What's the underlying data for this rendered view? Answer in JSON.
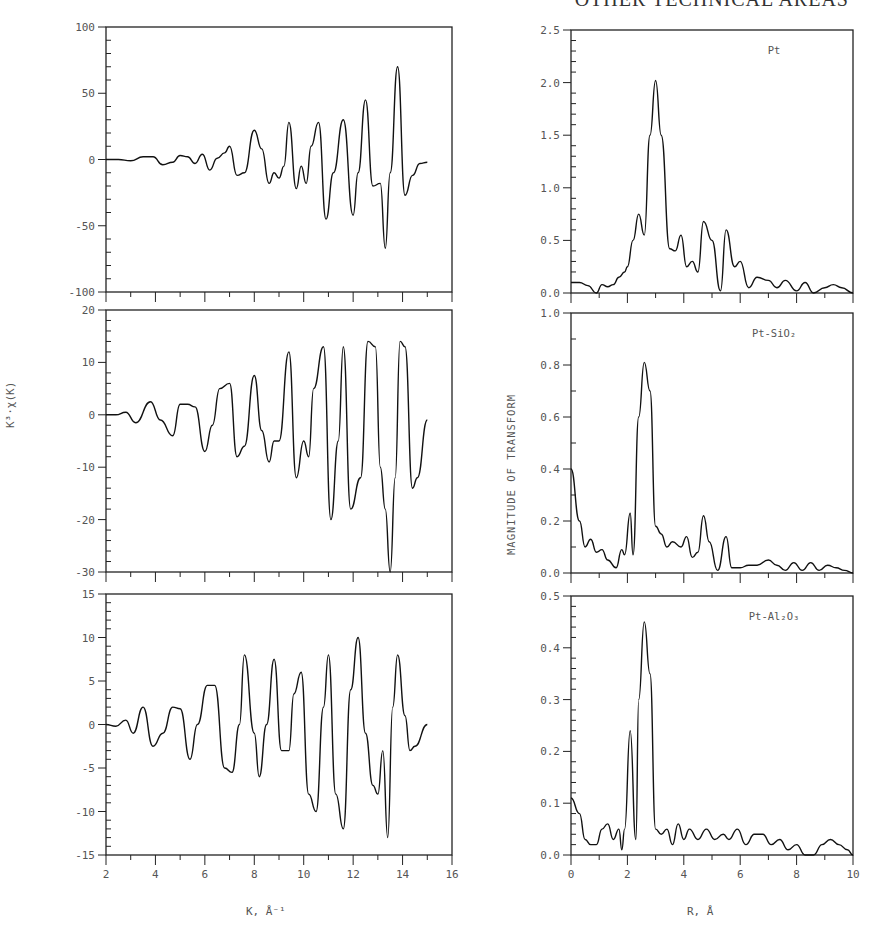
{
  "header": {
    "text": "OTHER TECHNICAL AREAS"
  },
  "left_column": {
    "ylabel": "K³·χ(K)",
    "xlabel": "K, Å⁻¹",
    "xticks": [
      "2",
      "4",
      "6",
      "8",
      "10",
      "12",
      "14",
      "16"
    ]
  },
  "right_column": {
    "ylabel": "MAGNITUDE OF TRANSFORM",
    "xlabel": "R, Å",
    "xticks": [
      "0",
      "2",
      "4",
      "6",
      "8",
      "10"
    ]
  },
  "chart_data": [
    {
      "id": "chi-pt",
      "type": "line",
      "panel": "left-top",
      "title": "",
      "xlabel": "K, Å⁻¹",
      "ylabel": "K³·χ(K)",
      "xlim": [
        2,
        16
      ],
      "ylim": [
        -100,
        100
      ],
      "yticks": [
        "100",
        "50",
        "0",
        "-50",
        "-100"
      ],
      "grid": false,
      "x": [
        2.0,
        2.5,
        3.0,
        3.5,
        3.9,
        4.3,
        4.7,
        5.0,
        5.3,
        5.6,
        5.9,
        6.2,
        6.5,
        6.8,
        7.0,
        7.3,
        7.6,
        8.0,
        8.3,
        8.6,
        8.8,
        9.0,
        9.2,
        9.4,
        9.7,
        9.9,
        10.1,
        10.3,
        10.6,
        10.9,
        11.2,
        11.6,
        12.0,
        12.2,
        12.5,
        12.8,
        13.1,
        13.3,
        13.5,
        13.8,
        14.1,
        14.4,
        14.7,
        15.0
      ],
      "values": [
        0,
        0,
        -1,
        2,
        2,
        -4,
        -2,
        3,
        2,
        -3,
        4,
        -8,
        1,
        5,
        10,
        -12,
        -10,
        22,
        8,
        -18,
        -10,
        -14,
        -5,
        28,
        -22,
        -5,
        -18,
        10,
        28,
        -45,
        -10,
        30,
        -42,
        -10,
        45,
        -20,
        -18,
        -67,
        -10,
        70,
        -27,
        -12,
        -3,
        -2
      ]
    },
    {
      "id": "chi-pt-sio2",
      "type": "line",
      "panel": "left-middle",
      "title": "",
      "xlabel": "K, Å⁻¹",
      "ylabel": "K³·χ(K)",
      "xlim": [
        2,
        16
      ],
      "ylim": [
        -30,
        20
      ],
      "yticks": [
        "20",
        "10",
        "0",
        "-10",
        "-20",
        "-30"
      ],
      "grid": false,
      "x": [
        2.0,
        2.4,
        2.8,
        3.2,
        3.8,
        4.2,
        4.7,
        5.0,
        5.3,
        5.6,
        6.0,
        6.3,
        6.6,
        7.0,
        7.3,
        7.6,
        8.0,
        8.3,
        8.6,
        8.8,
        9.0,
        9.4,
        9.7,
        10.0,
        10.2,
        10.4,
        10.8,
        11.1,
        11.4,
        11.6,
        11.9,
        12.3,
        12.6,
        12.9,
        13.1,
        13.3,
        13.5,
        13.7,
        13.9,
        14.1,
        14.4,
        14.6,
        15.0
      ],
      "values": [
        0,
        0,
        0.5,
        -1.5,
        2.5,
        -1,
        -4,
        2,
        2,
        1.5,
        -7,
        -2,
        5,
        6,
        -8,
        -6,
        7.5,
        -3,
        -9,
        -5,
        -5,
        12,
        -12,
        -5,
        -8,
        5,
        13,
        -20,
        -5,
        13,
        -18,
        -12,
        14,
        13,
        -10,
        -18,
        -30,
        -12,
        14,
        13,
        -14,
        -12,
        -1
      ]
    },
    {
      "id": "chi-pt-al2o3",
      "type": "line",
      "panel": "left-bottom",
      "title": "",
      "xlabel": "K, Å⁻¹",
      "ylabel": "K³·χ(K)",
      "xlim": [
        2,
        16
      ],
      "ylim": [
        -15,
        15
      ],
      "yticks": [
        "15",
        "10",
        "5",
        "0",
        "-5",
        "-10",
        "-15"
      ],
      "grid": false,
      "x": [
        2.0,
        2.4,
        2.8,
        3.1,
        3.5,
        3.9,
        4.3,
        4.7,
        5.0,
        5.4,
        5.7,
        6.1,
        6.4,
        6.8,
        7.1,
        7.4,
        7.6,
        8.0,
        8.2,
        8.5,
        8.8,
        9.1,
        9.4,
        9.6,
        9.9,
        10.2,
        10.5,
        10.8,
        11.0,
        11.3,
        11.6,
        11.9,
        12.2,
        12.5,
        12.8,
        13.0,
        13.2,
        13.4,
        13.6,
        13.8,
        14.1,
        14.3,
        14.5,
        15.0
      ],
      "values": [
        0,
        -0.2,
        0.5,
        -1,
        2,
        -2.5,
        -1,
        2,
        1.8,
        -4,
        0,
        4.5,
        4.5,
        -5,
        -5.5,
        0,
        8,
        -1,
        -6,
        0,
        7.5,
        -3,
        -3,
        3.5,
        6,
        -8,
        -10,
        2,
        8,
        -8,
        -12,
        4,
        10,
        -1,
        -7,
        -8,
        -3,
        -13,
        2,
        8,
        1,
        -3,
        -2.5,
        0
      ]
    },
    {
      "id": "ft-pt",
      "type": "line",
      "panel": "right-top",
      "title": "Pt",
      "xlabel": "R, Å",
      "ylabel": "MAGNITUDE OF TRANSFORM",
      "xlim": [
        0,
        10
      ],
      "ylim": [
        0.0,
        2.5
      ],
      "yticks": [
        "2.5",
        "2.0",
        "1.5",
        "1.0",
        "0.5",
        "0.0"
      ],
      "grid": false,
      "x": [
        0.0,
        0.3,
        0.6,
        0.9,
        1.1,
        1.3,
        1.5,
        1.7,
        1.9,
        2.0,
        2.2,
        2.4,
        2.6,
        2.8,
        3.0,
        3.2,
        3.5,
        3.7,
        3.9,
        4.1,
        4.3,
        4.5,
        4.7,
        5.0,
        5.3,
        5.5,
        5.8,
        6.0,
        6.3,
        6.6,
        7.0,
        7.3,
        7.6,
        8.0,
        8.3,
        8.6,
        9.0,
        9.3,
        9.6,
        10.0
      ],
      "values": [
        0.1,
        0.1,
        0.07,
        0.0,
        0.08,
        0.06,
        0.08,
        0.15,
        0.2,
        0.25,
        0.5,
        0.75,
        0.55,
        1.5,
        2.02,
        1.5,
        0.42,
        0.4,
        0.55,
        0.25,
        0.3,
        0.2,
        0.68,
        0.5,
        0.02,
        0.6,
        0.25,
        0.3,
        0.05,
        0.15,
        0.12,
        0.05,
        0.12,
        0.02,
        0.1,
        0.0,
        0.05,
        0.08,
        0.05,
        0.0
      ]
    },
    {
      "id": "ft-pt-sio2",
      "type": "line",
      "panel": "right-middle",
      "title": "Pt-SiO₂",
      "xlabel": "R, Å",
      "ylabel": "MAGNITUDE OF TRANSFORM",
      "xlim": [
        0,
        10
      ],
      "ylim": [
        0.0,
        1.0
      ],
      "yticks": [
        "1.0",
        "0.8",
        "0.6",
        "0.4",
        "0.2",
        "0.0"
      ],
      "grid": false,
      "x": [
        0.0,
        0.3,
        0.5,
        0.7,
        0.9,
        1.1,
        1.3,
        1.6,
        1.8,
        1.9,
        2.1,
        2.2,
        2.4,
        2.6,
        2.8,
        3.0,
        3.2,
        3.4,
        3.6,
        3.9,
        4.1,
        4.3,
        4.5,
        4.7,
        4.9,
        5.2,
        5.5,
        5.7,
        6.0,
        6.3,
        6.6,
        7.0,
        7.3,
        7.6,
        7.9,
        8.2,
        8.5,
        8.8,
        9.1,
        9.4,
        9.7,
        10.0
      ],
      "values": [
        0.4,
        0.2,
        0.1,
        0.13,
        0.08,
        0.09,
        0.05,
        0.02,
        0.09,
        0.07,
        0.23,
        0.07,
        0.6,
        0.81,
        0.7,
        0.18,
        0.15,
        0.1,
        0.12,
        0.1,
        0.14,
        0.06,
        0.08,
        0.22,
        0.12,
        0.01,
        0.14,
        0.02,
        0.02,
        0.03,
        0.03,
        0.05,
        0.03,
        0.01,
        0.04,
        0.01,
        0.04,
        0.01,
        0.03,
        0.02,
        0.01,
        0.0
      ]
    },
    {
      "id": "ft-pt-al2o3",
      "type": "line",
      "panel": "right-bottom",
      "title": "Pt-Al₂O₃",
      "xlabel": "R, Å",
      "ylabel": "MAGNITUDE OF TRANSFORM",
      "xlim": [
        0,
        10
      ],
      "ylim": [
        0.0,
        0.5
      ],
      "yticks": [
        "0.5",
        "0.4",
        "0.3",
        "0.2",
        "0.1",
        "0.0"
      ],
      "grid": false,
      "x": [
        0.0,
        0.3,
        0.5,
        0.7,
        0.9,
        1.1,
        1.3,
        1.5,
        1.7,
        1.8,
        1.9,
        2.1,
        2.3,
        2.4,
        2.6,
        2.8,
        3.0,
        3.2,
        3.4,
        3.6,
        3.8,
        4.0,
        4.2,
        4.5,
        4.8,
        5.1,
        5.4,
        5.6,
        5.9,
        6.2,
        6.5,
        6.8,
        7.1,
        7.4,
        7.7,
        8.0,
        8.3,
        8.6,
        8.9,
        9.2,
        9.5,
        9.8,
        10.0
      ],
      "values": [
        0.11,
        0.08,
        0.03,
        0.02,
        0.02,
        0.05,
        0.06,
        0.03,
        0.05,
        0.01,
        0.05,
        0.24,
        0.03,
        0.3,
        0.45,
        0.35,
        0.05,
        0.04,
        0.05,
        0.02,
        0.06,
        0.03,
        0.05,
        0.03,
        0.05,
        0.03,
        0.04,
        0.03,
        0.05,
        0.02,
        0.04,
        0.04,
        0.02,
        0.03,
        0.01,
        0.02,
        0.0,
        0.0,
        0.02,
        0.03,
        0.02,
        0.01,
        0.0
      ]
    }
  ]
}
